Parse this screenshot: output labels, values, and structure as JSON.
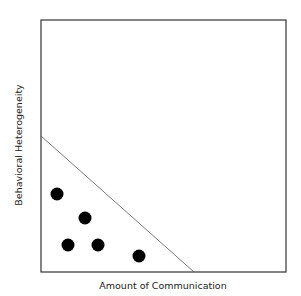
{
  "chart_data": {
    "type": "scatter",
    "title": "",
    "xlabel": "Amount of Communication",
    "ylabel": "Behavioral Heterogeneity",
    "ticks": "none",
    "grid": false,
    "legend": "none",
    "frame": {
      "left": 41,
      "top": 20,
      "right": 286,
      "bottom": 272
    },
    "points": [
      {
        "x": 57,
        "y": 194
      },
      {
        "x": 85,
        "y": 218
      },
      {
        "x": 68,
        "y": 245
      },
      {
        "x": 98,
        "y": 245
      },
      {
        "x": 139,
        "y": 256
      }
    ],
    "boundary_line": {
      "x1": 41,
      "y1": 136,
      "x2": 194,
      "y2": 272
    },
    "colors": {
      "points": "#000000",
      "axes": "#333333",
      "line": "#555555"
    }
  }
}
